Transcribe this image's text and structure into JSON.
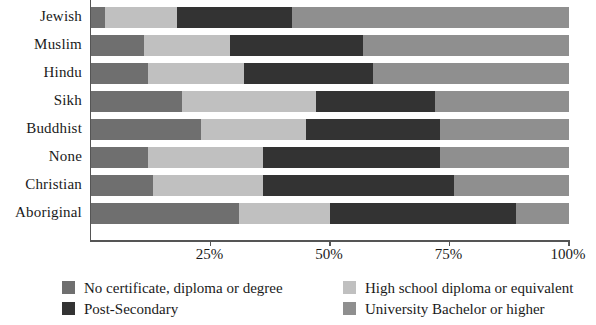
{
  "chart_data": {
    "type": "bar",
    "orientation": "horizontal",
    "stacked": true,
    "normalized": "100%",
    "title": "",
    "subtitle": "",
    "xlabel": "",
    "ylabel": "",
    "xlim": [
      0,
      100
    ],
    "grid": false,
    "legend_position": "bottom",
    "categories": [
      "Jewish",
      "Muslim",
      "Hindu",
      "Sikh",
      "Buddhist",
      "None",
      "Christian",
      "Aboriginal"
    ],
    "xtick_values": [
      25,
      50,
      75,
      100
    ],
    "xtick_labels": [
      "25%",
      "50%",
      "75%",
      "100%"
    ],
    "series": [
      {
        "name": "No certificate, diploma or degree",
        "color": "#6f6f6f",
        "values": [
          3,
          11,
          12,
          19,
          23,
          12,
          13,
          31
        ]
      },
      {
        "name": "High school diploma or equivalent",
        "color": "#c0c0c0",
        "values": [
          15,
          18,
          20,
          28,
          22,
          24,
          23,
          19
        ]
      },
      {
        "name": "Post-Secondary",
        "color": "#333333",
        "values": [
          24,
          28,
          27,
          25,
          28,
          37,
          40,
          39
        ]
      },
      {
        "name": "University Bachelor or higher",
        "color": "#8f8f8f",
        "values": [
          58,
          43,
          41,
          28,
          27,
          27,
          24,
          11
        ]
      }
    ]
  },
  "legend": {
    "items": [
      {
        "label": "No certificate, diploma or degree",
        "color": "#6f6f6f"
      },
      {
        "label": "Post-Secondary",
        "color": "#333333"
      },
      {
        "label": "High school diploma or equivalent",
        "color": "#c0c0c0"
      },
      {
        "label": "University Bachelor or higher",
        "color": "#8f8f8f"
      }
    ]
  }
}
